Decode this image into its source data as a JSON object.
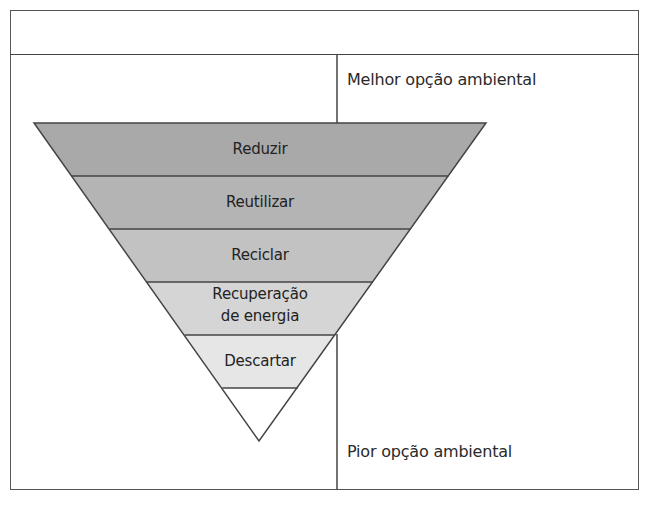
{
  "header": {
    "title": ""
  },
  "hierarchy": {
    "levels": [
      {
        "label": "Reduzir",
        "fill": "#a9a9a9"
      },
      {
        "label": "Reutilizar",
        "fill": "#b4b4b4"
      },
      {
        "label": "Reciclar",
        "fill": "#c2c2c2"
      },
      {
        "label_line1": "Recuperação",
        "label_line2": "de energia",
        "fill": "#d5d5d5"
      },
      {
        "label": "Descartar",
        "fill": "#e6e6e6"
      },
      {
        "label": "",
        "fill": "#ffffff"
      }
    ]
  },
  "axis": {
    "best_label": "Melhor opção ambiental",
    "worst_label": "Pior opção ambiental"
  },
  "colors": {
    "stroke": "#444444",
    "text": "#2a2a2a",
    "background": "#ffffff"
  }
}
